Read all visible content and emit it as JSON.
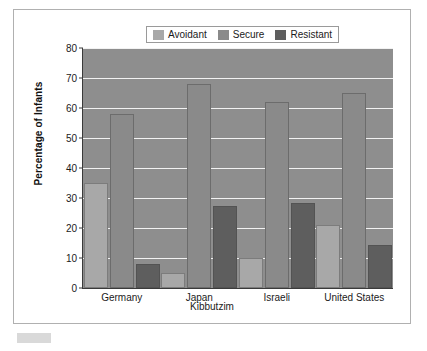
{
  "figure": {
    "background_color": "#ffffff",
    "frame_border_color": "#b0b0b0",
    "plot_background_color": "#8e8e8e",
    "gridline_color": "#f2f2f2",
    "axis_color": "#3a3a3a"
  },
  "legend": {
    "position": "top-center",
    "entries": [
      {
        "label": "Avoidant",
        "color": "#a8a8a8"
      },
      {
        "label": "Secure",
        "color": "#8a8a8a"
      },
      {
        "label": "Resistant",
        "color": "#5e5e5e"
      }
    ]
  },
  "chart_data": {
    "type": "bar",
    "title": "",
    "xlabel": "Kibbutzim",
    "ylabel": "Percentage of Infants",
    "categories": [
      "Germany",
      "Japan",
      "Israeli",
      "United States"
    ],
    "category_display": [
      {
        "line1": "Germany",
        "line2": ""
      },
      {
        "line1": "Japan",
        "line2": ""
      },
      {
        "line1": "Israeli",
        "line2": ""
      },
      {
        "line1": "United States",
        "line2": ""
      }
    ],
    "series": [
      {
        "name": "Avoidant",
        "color": "#a8a8a8",
        "values": [
          35,
          5,
          10,
          21
        ]
      },
      {
        "name": "Secure",
        "color": "#8a8a8a",
        "values": [
          58,
          68,
          62,
          65
        ]
      },
      {
        "name": "Resistant",
        "color": "#5e5e5e",
        "values": [
          8,
          27.5,
          28.5,
          14.5
        ]
      }
    ],
    "ylim": [
      0,
      80
    ],
    "yticks": [
      0,
      10,
      20,
      30,
      40,
      50,
      60,
      70,
      80
    ],
    "ytick_labels": [
      "0",
      "10",
      "20",
      "30",
      "40",
      "50",
      "60",
      "70",
      "80"
    ],
    "grid": true,
    "legend_position": "top-center"
  }
}
